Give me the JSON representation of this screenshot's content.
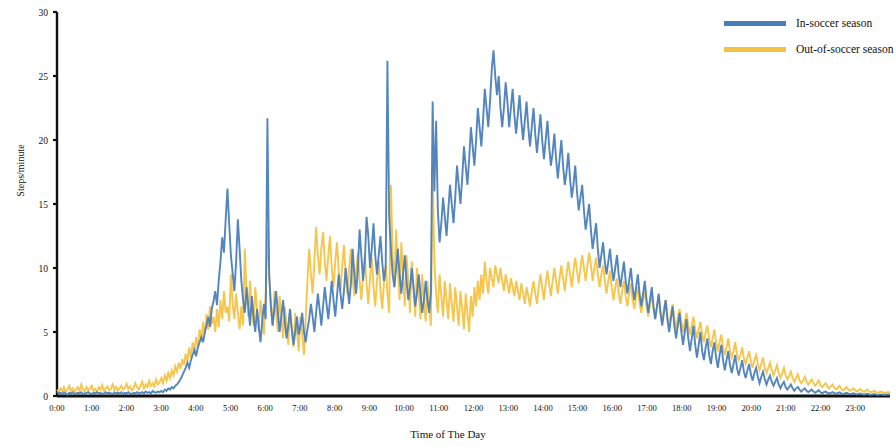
{
  "chart_data": {
    "type": "line",
    "title": "",
    "xlabel": "Time of The Day",
    "ylabel": "Steps/minute",
    "xlim": [
      0,
      24
    ],
    "ylim": [
      0,
      30
    ],
    "yticks": [
      0,
      5,
      10,
      15,
      20,
      25,
      30
    ],
    "ytick_labels": [
      "0",
      "5",
      "10",
      "15",
      "20",
      "25",
      "30"
    ],
    "xticks": [
      0,
      1,
      2,
      3,
      4,
      5,
      6,
      7,
      8,
      9,
      10,
      11,
      12,
      13,
      14,
      15,
      16,
      17,
      18,
      19,
      20,
      21,
      22,
      23
    ],
    "xtick_labels": [
      "0:00",
      "1:00",
      "2:00",
      "3:00",
      "4:00",
      "5:00",
      "6:00",
      "7:00",
      "8:00",
      "9:00",
      "10:00",
      "11:00",
      "12:00",
      "13:00",
      "14:00",
      "15:00",
      "16:00",
      "17:00",
      "18:00",
      "19:00",
      "20:00",
      "21:00",
      "22:00",
      "23:00"
    ],
    "grid": false,
    "legend_position": "top-right",
    "colors": {
      "in_season": "#4A7EBB",
      "out_season": "#F5C242",
      "axis": "#111111"
    },
    "series": [
      {
        "name": "In-soccer season",
        "color": "#4A7EBB",
        "x_step_minutes": 5,
        "values": [
          0.3,
          0.2,
          0.25,
          0.15,
          0.3,
          0.2,
          0.1,
          0.25,
          0.2,
          0.3,
          0.15,
          0.2,
          0.25,
          0.2,
          0.3,
          0.15,
          0.2,
          0.25,
          0.3,
          0.2,
          0.15,
          0.25,
          0.2,
          0.3,
          0.2,
          0.25,
          0.15,
          0.2,
          0.3,
          0.2,
          0.25,
          0.2,
          0.15,
          0.3,
          0.2,
          0.25,
          0.2,
          0.3,
          0.15,
          0.25,
          0.2,
          0.3,
          0.2,
          0.15,
          0.25,
          0.2,
          0.3,
          0.2,
          0.25,
          0.3,
          0.2,
          0.35,
          0.25,
          0.3,
          0.2,
          0.4,
          0.3,
          0.25,
          0.35,
          0.3,
          0.4,
          0.3,
          0.5,
          0.4,
          0.6,
          0.5,
          0.7,
          0.6,
          0.8,
          0.9,
          1.1,
          1.3,
          1.6,
          1.9,
          2.2,
          2.6,
          2.2,
          2.8,
          3.2,
          3.6,
          3.1,
          3.8,
          4.2,
          4.6,
          4.2,
          5.0,
          5.5,
          6.2,
          5.4,
          6.8,
          7.4,
          8.2,
          7.1,
          9.0,
          10.5,
          12.4,
          11.2,
          13.8,
          16.2,
          13.5,
          11.0,
          9.6,
          8.2,
          10.5,
          13.8,
          11.5,
          9.0,
          7.5,
          6.5,
          8.5,
          7.0,
          5.5,
          7.8,
          6.2,
          5.0,
          6.8,
          5.5,
          4.2,
          5.8,
          7.2,
          6.0,
          21.7,
          9.5,
          7.0,
          5.5,
          6.8,
          8.2,
          6.5,
          5.0,
          6.2,
          7.5,
          5.8,
          4.5,
          5.5,
          6.8,
          5.2,
          4.0,
          5.0,
          6.2,
          4.8,
          5.5,
          6.5,
          5.0,
          4.2,
          5.2,
          6.0,
          7.2,
          6.2,
          5.0,
          6.5,
          8.0,
          6.8,
          5.5,
          7.0,
          8.5,
          7.2,
          6.0,
          7.5,
          9.0,
          7.5,
          6.2,
          7.8,
          9.5,
          8.0,
          6.8,
          8.2,
          10.0,
          8.5,
          7.2,
          8.8,
          11.5,
          9.5,
          8.0,
          9.8,
          13.0,
          11.0,
          9.0,
          10.5,
          14.0,
          12.5,
          10.0,
          11.5,
          13.5,
          11.0,
          9.5,
          11.0,
          12.5,
          10.5,
          9.0,
          10.0,
          26.2,
          14.0,
          11.5,
          9.5,
          8.5,
          10.0,
          11.5,
          9.5,
          8.0,
          9.5,
          11.0,
          9.0,
          7.5,
          8.5,
          10.0,
          8.5,
          7.0,
          8.0,
          9.5,
          8.0,
          6.5,
          7.5,
          9.0,
          7.5,
          6.5,
          8.0,
          23.0,
          16.0,
          21.5,
          14.5,
          12.0,
          13.5,
          15.5,
          14.0,
          12.5,
          14.5,
          16.5,
          15.0,
          13.5,
          15.5,
          18.0,
          16.5,
          15.0,
          17.0,
          19.5,
          18.0,
          16.5,
          18.5,
          21.0,
          19.5,
          18.0,
          20.0,
          22.5,
          21.0,
          19.5,
          21.5,
          24.0,
          22.5,
          21.0,
          23.0,
          25.5,
          27.0,
          25.0,
          23.5,
          25.0,
          22.5,
          21.0,
          22.5,
          24.5,
          23.0,
          21.0,
          22.5,
          24.0,
          22.0,
          20.5,
          22.0,
          23.5,
          21.5,
          20.0,
          21.5,
          23.0,
          21.0,
          19.5,
          21.0,
          22.5,
          20.5,
          19.0,
          20.5,
          22.0,
          20.0,
          18.5,
          20.0,
          21.5,
          19.5,
          18.0,
          19.0,
          20.5,
          18.5,
          17.0,
          18.5,
          20.0,
          18.0,
          16.5,
          17.5,
          19.0,
          17.0,
          15.5,
          16.5,
          18.0,
          16.0,
          14.5,
          15.5,
          16.5,
          14.5,
          13.0,
          14.0,
          15.0,
          13.0,
          11.5,
          12.5,
          13.5,
          11.5,
          10.0,
          11.0,
          12.0,
          10.5,
          9.5,
          10.5,
          11.5,
          10.0,
          9.0,
          10.0,
          11.0,
          9.5,
          8.5,
          9.5,
          10.5,
          9.0,
          8.0,
          9.0,
          10.0,
          8.5,
          7.5,
          8.5,
          9.5,
          8.0,
          7.0,
          8.0,
          9.0,
          7.5,
          6.5,
          7.5,
          8.5,
          7.0,
          6.0,
          7.0,
          8.0,
          6.5,
          5.5,
          6.5,
          7.5,
          6.0,
          5.0,
          6.0,
          7.0,
          5.5,
          4.5,
          5.5,
          6.5,
          5.0,
          4.0,
          5.0,
          6.0,
          4.5,
          3.5,
          4.5,
          5.5,
          4.0,
          3.0,
          4.0,
          5.0,
          3.5,
          2.8,
          3.8,
          4.5,
          3.2,
          2.5,
          3.5,
          4.2,
          3.0,
          2.2,
          3.2,
          4.0,
          2.8,
          2.0,
          2.8,
          3.5,
          2.4,
          1.8,
          2.5,
          3.2,
          2.2,
          1.6,
          2.2,
          2.8,
          1.9,
          1.4,
          2.0,
          2.5,
          1.7,
          1.2,
          1.8,
          2.2,
          1.5,
          1.0,
          1.5,
          1.9,
          1.3,
          0.9,
          1.3,
          1.6,
          1.1,
          0.8,
          1.1,
          1.4,
          0.9,
          0.6,
          0.9,
          1.1,
          0.7,
          0.5,
          0.7,
          0.9,
          0.6,
          0.4,
          0.6,
          0.7,
          0.5,
          0.35,
          0.5,
          0.6,
          0.4,
          0.3,
          0.4,
          0.5,
          0.35,
          0.25,
          0.35,
          0.45,
          0.3,
          0.2,
          0.3,
          0.35,
          0.25,
          0.2,
          0.25,
          0.3,
          0.22,
          0.18,
          0.22,
          0.28,
          0.2,
          0.15,
          0.2,
          0.25,
          0.18,
          0.15,
          0.18,
          0.22,
          0.16,
          0.12,
          0.16,
          0.2,
          0.14,
          0.1,
          0.14,
          0.18,
          0.12,
          0.1,
          0.12,
          0.15,
          0.11,
          0.08,
          0.11,
          0.13,
          0.1,
          0.08,
          0.1,
          0.12,
          0.08
        ]
      },
      {
        "name": "Out-of-soccer season",
        "color": "#F5C242",
        "x_step_minutes": 5,
        "values": [
          0.5,
          0.3,
          0.6,
          0.4,
          0.7,
          0.35,
          0.5,
          0.8,
          0.4,
          0.6,
          0.3,
          0.55,
          0.7,
          0.4,
          0.9,
          0.5,
          0.35,
          0.7,
          0.45,
          0.6,
          0.8,
          0.4,
          0.55,
          0.3,
          0.7,
          0.5,
          0.85,
          0.4,
          0.6,
          0.75,
          0.45,
          0.55,
          0.9,
          0.5,
          0.7,
          0.4,
          0.6,
          0.8,
          0.5,
          0.65,
          0.95,
          0.55,
          0.75,
          0.45,
          0.6,
          1.0,
          0.7,
          0.5,
          0.8,
          1.1,
          0.6,
          0.9,
          0.7,
          1.2,
          0.8,
          1.0,
          0.75,
          1.3,
          0.9,
          1.1,
          1.4,
          1.0,
          1.6,
          1.2,
          1.8,
          1.4,
          2.0,
          1.6,
          2.3,
          1.9,
          2.6,
          2.1,
          2.9,
          2.4,
          3.3,
          2.7,
          3.8,
          3.0,
          4.2,
          3.4,
          4.6,
          3.8,
          5.2,
          4.3,
          5.8,
          4.8,
          6.4,
          5.2,
          7.0,
          5.6,
          6.2,
          5.0,
          6.8,
          5.4,
          7.5,
          6.0,
          8.2,
          6.5,
          7.0,
          5.8,
          9.5,
          7.2,
          6.0,
          8.0,
          6.5,
          5.2,
          7.0,
          5.5,
          11.5,
          8.0,
          6.2,
          9.0,
          7.0,
          5.5,
          8.5,
          6.8,
          5.0,
          7.5,
          6.0,
          4.8,
          8.0,
          13.0,
          9.5,
          7.0,
          5.5,
          8.2,
          6.5,
          5.0,
          7.8,
          6.2,
          4.5,
          7.0,
          5.5,
          4.0,
          6.8,
          5.2,
          3.8,
          6.5,
          5.0,
          3.5,
          6.2,
          4.8,
          3.2,
          6.0,
          9.0,
          11.5,
          9.5,
          8.0,
          10.5,
          13.2,
          11.0,
          9.5,
          11.5,
          12.8,
          10.5,
          9.0,
          11.0,
          12.5,
          10.0,
          8.5,
          10.5,
          12.0,
          9.8,
          8.2,
          10.2,
          11.8,
          9.5,
          8.0,
          10.0,
          11.5,
          9.2,
          7.8,
          9.8,
          11.2,
          9.0,
          7.5,
          9.5,
          11.0,
          8.8,
          7.2,
          9.2,
          10.8,
          8.5,
          7.0,
          9.0,
          10.5,
          8.2,
          6.8,
          8.8,
          10.2,
          8.0,
          6.5,
          16.5,
          11.0,
          8.5,
          13.0,
          10.0,
          7.5,
          12.0,
          9.5,
          7.0,
          11.0,
          9.0,
          6.5,
          10.5,
          8.5,
          6.2,
          10.0,
          8.0,
          6.0,
          9.5,
          7.5,
          5.8,
          9.0,
          7.2,
          5.5,
          18.0,
          10.5,
          8.0,
          6.5,
          9.5,
          7.8,
          6.2,
          9.0,
          7.5,
          6.0,
          8.8,
          7.2,
          5.8,
          8.5,
          7.0,
          5.5,
          8.2,
          6.8,
          5.2,
          8.0,
          6.5,
          5.0,
          7.8,
          6.2,
          8.5,
          7.0,
          9.0,
          7.5,
          9.5,
          8.0,
          10.5,
          9.0,
          8.0,
          10.0,
          9.2,
          8.5,
          10.2,
          9.5,
          8.8,
          10.0,
          9.0,
          8.2,
          9.5,
          8.8,
          8.0,
          9.2,
          8.5,
          7.8,
          9.0,
          8.2,
          7.5,
          8.8,
          8.0,
          7.2,
          8.5,
          7.8,
          7.0,
          8.2,
          9.0,
          8.0,
          7.2,
          8.5,
          9.5,
          8.5,
          7.5,
          8.8,
          9.8,
          8.8,
          7.8,
          9.0,
          10.0,
          9.0,
          8.0,
          9.2,
          10.2,
          9.2,
          8.2,
          9.5,
          10.5,
          9.5,
          8.5,
          9.8,
          10.8,
          9.8,
          8.8,
          10.0,
          11.0,
          10.0,
          9.0,
          10.2,
          11.2,
          10.2,
          9.0,
          10.0,
          10.8,
          9.5,
          8.5,
          9.5,
          10.2,
          9.0,
          8.0,
          9.0,
          9.8,
          8.5,
          7.5,
          8.5,
          9.2,
          8.0,
          7.2,
          8.2,
          9.0,
          7.8,
          7.0,
          8.0,
          8.8,
          7.5,
          6.8,
          7.8,
          8.5,
          7.2,
          6.5,
          7.5,
          8.2,
          7.0,
          6.2,
          7.2,
          8.0,
          6.8,
          6.0,
          7.0,
          7.8,
          6.5,
          5.8,
          6.8,
          7.5,
          6.2,
          5.5,
          6.5,
          7.2,
          6.0,
          5.2,
          6.2,
          6.8,
          5.8,
          5.0,
          5.8,
          6.5,
          5.5,
          4.8,
          5.5,
          6.2,
          5.2,
          4.5,
          5.2,
          5.8,
          4.8,
          4.2,
          5.0,
          5.5,
          4.5,
          3.8,
          4.5,
          5.2,
          4.2,
          3.5,
          4.2,
          4.8,
          3.8,
          3.2,
          3.8,
          4.5,
          3.5,
          3.0,
          3.5,
          4.2,
          3.2,
          2.8,
          3.2,
          3.8,
          2.9,
          2.5,
          3.0,
          3.5,
          2.7,
          2.2,
          2.8,
          3.2,
          2.5,
          2.0,
          2.5,
          3.0,
          2.2,
          1.8,
          2.2,
          2.6,
          2.0,
          1.6,
          2.0,
          2.4,
          1.8,
          1.4,
          1.8,
          2.2,
          1.6,
          1.3,
          1.6,
          1.9,
          1.4,
          1.1,
          1.4,
          1.7,
          1.2,
          1.0,
          1.2,
          1.5,
          1.1,
          0.9,
          1.1,
          1.3,
          1.0,
          0.8,
          1.0,
          1.2,
          0.85,
          0.7,
          0.85,
          1.0,
          0.75,
          0.6,
          0.75,
          0.9,
          0.65,
          0.5,
          0.65,
          0.8,
          0.55,
          0.45,
          0.55,
          0.7,
          0.5,
          0.4,
          0.5,
          0.6,
          0.45,
          0.35,
          0.45,
          0.55,
          0.4,
          0.3,
          0.4,
          0.5,
          0.35,
          0.3,
          0.35,
          0.4,
          0.3,
          0.25,
          0.3,
          0.35,
          0.28,
          0.22,
          0.28,
          0.32,
          0.25
        ]
      }
    ]
  },
  "legend": {
    "items": [
      {
        "label": "In-soccer season",
        "color": "#4A7EBB"
      },
      {
        "label": "Out-of-soccer season",
        "color": "#F5C242"
      }
    ]
  },
  "axes": {
    "y_title": "Steps/minute",
    "x_title": "Time of The Day"
  }
}
